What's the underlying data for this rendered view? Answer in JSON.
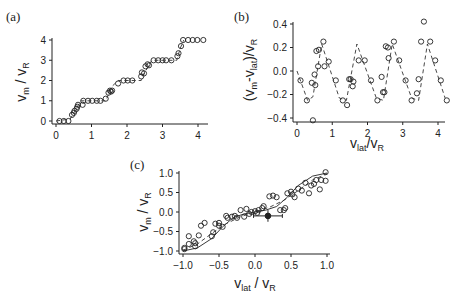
{
  "chart_data": [
    {
      "id": "a",
      "panel_label": "(a)",
      "type": "scatter",
      "title": "",
      "xlabel": "",
      "ylabel": "v_m / v_R",
      "xlim": [
        0,
        4.2
      ],
      "ylim": [
        0,
        4
      ],
      "xticks": [
        0,
        1,
        2,
        3,
        4
      ],
      "yticks": [
        0,
        1,
        2,
        3,
        4
      ],
      "grid": false,
      "series": [
        {
          "name": "measured",
          "style": "open-circle",
          "x": [
            0.1,
            0.22,
            0.35,
            0.45,
            0.5,
            0.52,
            0.58,
            0.6,
            0.62,
            0.75,
            0.77,
            0.9,
            1.02,
            1.15,
            1.25,
            1.4,
            1.48,
            1.52,
            1.55,
            1.58,
            1.75,
            1.9,
            2.02,
            2.15,
            2.4,
            2.42,
            2.48,
            2.52,
            2.58,
            2.62,
            2.75,
            2.88,
            3.0,
            3.1,
            3.25,
            3.42,
            3.45,
            3.52,
            3.58,
            3.72,
            3.85,
            3.98,
            4.15
          ],
          "y": [
            0.0,
            0.0,
            0.0,
            0.3,
            0.4,
            0.5,
            0.6,
            0.7,
            0.8,
            0.8,
            1.0,
            1.0,
            1.0,
            1.0,
            1.0,
            1.1,
            1.4,
            1.5,
            1.45,
            1.5,
            1.85,
            2.0,
            2.0,
            2.0,
            2.2,
            2.4,
            2.35,
            2.7,
            2.8,
            2.75,
            3.0,
            3.0,
            3.0,
            3.0,
            3.0,
            3.2,
            3.35,
            3.7,
            4.0,
            4.0,
            4.0,
            4.0,
            4.0
          ]
        },
        {
          "name": "model",
          "style": "dashed",
          "x": [
            0.0,
            0.4,
            0.5,
            0.7,
            1.4,
            1.5,
            1.6,
            1.75,
            2.4,
            2.5,
            2.7,
            3.4,
            3.5,
            3.6
          ],
          "y": [
            0.0,
            0.1,
            0.4,
            1.0,
            1.0,
            1.4,
            1.75,
            2.0,
            2.0,
            2.4,
            3.0,
            3.0,
            3.6,
            4.0
          ]
        }
      ]
    },
    {
      "id": "b",
      "panel_label": "(b)",
      "type": "scatter",
      "title": "",
      "xlabel": "v_lat / v_R",
      "ylabel": "(v_m - v_lat) / v_R",
      "xlim": [
        0,
        4.2
      ],
      "ylim": [
        -0.44,
        0.44
      ],
      "xticks": [
        0,
        1,
        2,
        3,
        4
      ],
      "yticks": [
        -0.4,
        -0.2,
        0.0,
        0.2,
        0.4
      ],
      "ytick_labels": [
        "−0.4",
        "−0.2",
        "0.0",
        "0.2",
        "0.4"
      ],
      "grid": false,
      "series": [
        {
          "name": "measured",
          "style": "open-circle",
          "x": [
            0.1,
            0.28,
            0.42,
            0.45,
            0.5,
            0.52,
            0.55,
            0.6,
            0.62,
            0.75,
            0.78,
            0.9,
            1.1,
            1.3,
            1.42,
            1.48,
            1.52,
            1.58,
            1.6,
            1.75,
            1.92,
            2.1,
            2.28,
            2.4,
            2.44,
            2.48,
            2.52,
            2.58,
            2.6,
            2.75,
            2.9,
            3.08,
            3.25,
            3.4,
            3.45,
            3.52,
            3.6,
            3.78,
            3.92,
            4.08,
            4.25
          ],
          "y": [
            -0.08,
            -0.25,
            -0.1,
            -0.42,
            -0.03,
            -0.12,
            0.17,
            0.04,
            0.18,
            0.25,
            0.04,
            0.08,
            -0.08,
            -0.25,
            -0.29,
            -0.07,
            -0.07,
            -0.13,
            -0.09,
            0.09,
            0.09,
            -0.08,
            -0.25,
            -0.05,
            -0.18,
            -0.18,
            0.21,
            0.2,
            0.11,
            0.25,
            0.09,
            -0.08,
            -0.25,
            -0.19,
            -0.07,
            0.25,
            0.42,
            0.25,
            0.09,
            -0.08,
            -0.25
          ]
        },
        {
          "name": "model",
          "style": "dashed",
          "x": [
            0.0,
            0.3,
            0.45,
            0.7,
            1.2,
            1.4,
            1.7,
            2.25,
            2.45,
            2.7,
            3.25,
            3.45,
            3.7,
            4.2
          ],
          "y": [
            0.0,
            -0.25,
            -0.22,
            0.23,
            -0.23,
            -0.25,
            0.23,
            -0.23,
            -0.25,
            0.23,
            -0.23,
            -0.25,
            0.23,
            -0.23
          ]
        }
      ]
    },
    {
      "id": "c",
      "panel_label": "(c)",
      "type": "scatter",
      "title": "",
      "xlabel": "v_lat / v_R",
      "ylabel": "v_m / v_R",
      "xlim": [
        -1.0,
        1.0
      ],
      "ylim": [
        -1.05,
        1.05
      ],
      "xticks": [
        -1.0,
        -0.5,
        0.0,
        0.5,
        1.0
      ],
      "xtick_labels": [
        "−1.0",
        "−0.5",
        "0.0",
        "0.5",
        "1.0"
      ],
      "yticks": [
        -1.0,
        -0.5,
        0.0,
        0.5,
        1.0
      ],
      "ytick_labels": [
        "−1.0",
        "−0.5",
        "0.0",
        "0.5",
        "1.0"
      ],
      "grid": false,
      "series": [
        {
          "name": "measured",
          "style": "open-circle",
          "x": [
            -0.98,
            -0.98,
            -0.92,
            -0.92,
            -0.85,
            -0.83,
            -0.83,
            -0.78,
            -0.75,
            -0.7,
            -0.6,
            -0.58,
            -0.55,
            -0.5,
            -0.5,
            -0.45,
            -0.4,
            -0.38,
            -0.32,
            -0.28,
            -0.25,
            -0.2,
            -0.15,
            -0.12,
            -0.08,
            -0.05,
            0.0,
            0.03,
            0.05,
            0.1,
            0.12,
            0.2,
            0.25,
            0.3,
            0.35,
            0.4,
            0.42,
            0.45,
            0.5,
            0.52,
            0.55,
            0.6,
            0.65,
            0.7,
            0.75,
            0.78,
            0.82,
            0.85,
            0.9,
            0.92,
            0.98,
            0.98
          ],
          "y": [
            -0.95,
            -0.92,
            -0.62,
            -0.82,
            -0.75,
            -0.8,
            -0.88,
            -0.6,
            -0.35,
            -0.28,
            -0.62,
            -0.52,
            -0.3,
            -0.35,
            -0.28,
            -0.38,
            -0.1,
            -0.15,
            -0.12,
            -0.1,
            -0.15,
            0.05,
            -0.12,
            0.08,
            -0.05,
            0.0,
            0.02,
            -0.02,
            0.05,
            0.1,
            0.15,
            0.4,
            0.42,
            0.38,
            0.05,
            0.05,
            0.1,
            0.48,
            0.52,
            0.45,
            0.38,
            0.6,
            0.55,
            0.75,
            0.48,
            0.68,
            0.72,
            0.82,
            0.58,
            0.82,
            1.02,
            0.8
          ]
        },
        {
          "name": "errorbar-point",
          "style": "filled-circle-errorbar",
          "x": [
            0.18
          ],
          "y": [
            -0.1
          ],
          "xerr": [
            0.2
          ],
          "yerr": [
            0.15
          ]
        },
        {
          "name": "model-solid",
          "style": "solid",
          "x": [
            -1.0,
            -0.8,
            -0.6,
            -0.45,
            -0.3,
            -0.15,
            0.0,
            0.15,
            0.3,
            0.45,
            0.6,
            0.8,
            1.0
          ],
          "y": [
            -1.0,
            -0.92,
            -0.68,
            -0.38,
            -0.14,
            -0.05,
            0.0,
            0.05,
            0.14,
            0.38,
            0.68,
            0.92,
            1.0
          ]
        },
        {
          "name": "model-dashed",
          "style": "dashed",
          "x": [
            -1.0,
            -0.8,
            -0.6,
            -0.4,
            -0.2,
            0.0,
            0.2,
            0.4,
            0.6,
            0.8,
            1.0
          ],
          "y": [
            -0.98,
            -0.82,
            -0.55,
            -0.3,
            -0.12,
            0.0,
            0.12,
            0.3,
            0.55,
            0.82,
            0.98
          ]
        }
      ]
    }
  ],
  "panels": {
    "a": {
      "label": "(a)",
      "ylabel_main": "v",
      "ylabel_sub1": "m",
      "ylabel_mid": " / v",
      "ylabel_sub2": "R"
    },
    "b": {
      "label": "(b)",
      "ylabel_main": "(v",
      "ylabel_sub1": "m",
      "ylabel_mid": "-v",
      "ylabel_sub2": "lat",
      "ylabel_end": ")/v",
      "ylabel_sub3": "R",
      "xlabel_main": "v",
      "xlabel_sub1": "lat",
      "xlabel_mid": "/v",
      "xlabel_sub2": "R"
    },
    "c": {
      "label": "(c)",
      "ylabel_main": "v",
      "ylabel_sub1": "m",
      "ylabel_mid": " / v",
      "ylabel_sub2": "R",
      "xlabel_main": "v",
      "xlabel_sub1": "lat",
      "xlabel_mid": " / v",
      "xlabel_sub2": "R"
    }
  }
}
